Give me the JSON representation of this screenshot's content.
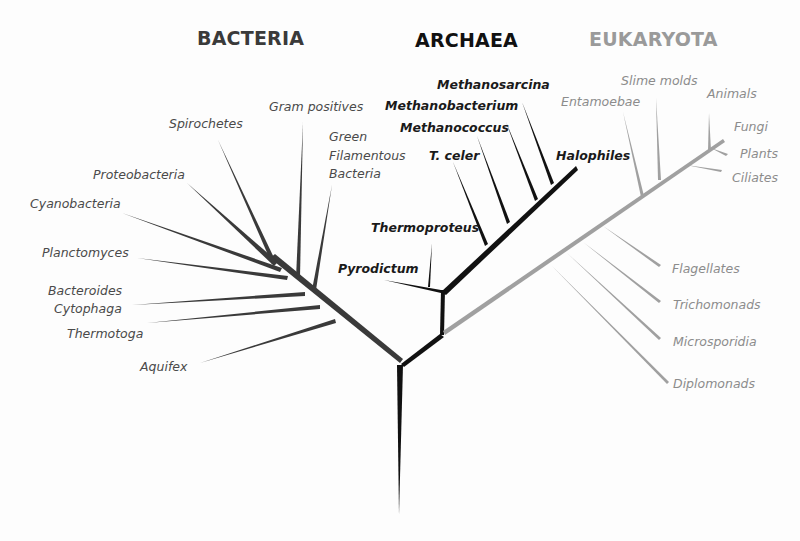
{
  "diagram": {
    "type": "phylogenetic-tree",
    "colors": {
      "bacteria": "#3a3a3a",
      "archaea": "#111111",
      "eukaryota": "#a0a0a0",
      "background": "#fdfdfd"
    },
    "domains": {
      "bacteria": {
        "title": "BACTERIA",
        "groups": [
          "Spirochetes",
          "Gram positives",
          "Green Filamentous Bacteria",
          "Proteobacteria",
          "Cyanobacteria",
          "Planctomyces",
          "Bacteroides Cytophaga",
          "Thermotoga",
          "Aquifex"
        ]
      },
      "archaea": {
        "title": "ARCHAEA",
        "groups": [
          "Methanosarcina",
          "Methanobacterium",
          "Methanococcus",
          "T. celer",
          "Halophiles",
          "Thermoproteus",
          "Pyrodictum"
        ]
      },
      "eukaryota": {
        "title": "EUKARYOTA",
        "groups": [
          "Slime molds",
          "Entamoebae",
          "Animals",
          "Fungi",
          "Plants",
          "Ciliates",
          "Flagellates",
          "Trichomonads",
          "Microsporidia",
          "Diplomonads"
        ]
      }
    },
    "labels": {
      "green1": "Green",
      "green2": "Filamentous",
      "green3": "Bacteria",
      "bact1": "Bacteroides",
      "bact2": "Cytophaga"
    }
  }
}
